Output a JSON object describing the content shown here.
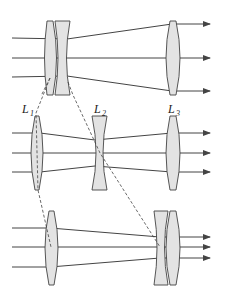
{
  "diagram": {
    "colors": {
      "lens_fill": "#e3e3e3",
      "stroke": "#444444",
      "background": "#ffffff"
    },
    "labels": {
      "L1": {
        "main": "L",
        "sub": "1"
      },
      "L2": {
        "main": "L",
        "sub": "2"
      },
      "L3": {
        "main": "L",
        "sub": "3"
      }
    },
    "panels": [
      {
        "name": "top",
        "config": "L1 and L2 adjacent, far from L3",
        "rays": 3
      },
      {
        "name": "middle",
        "config": "L1, L2, L3 spaced apart (labeled)",
        "rays": 3
      },
      {
        "name": "bottom",
        "config": "L2 adjacent to L3, L1 separated",
        "rays": 3
      }
    ]
  }
}
